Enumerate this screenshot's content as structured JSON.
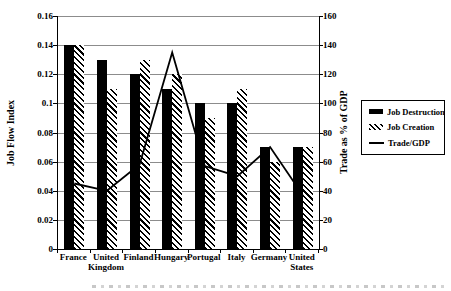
{
  "chart_data": {
    "type": "combo-bar-line",
    "title": "",
    "categories": [
      "France",
      "United Kingdom",
      "Finland",
      "Hungary",
      "Portugal",
      "Italy",
      "Germany",
      "United States"
    ],
    "series": [
      {
        "name": "Job Destruction",
        "type": "bar",
        "style": "solid-black",
        "axis": "left",
        "values": [
          0.14,
          0.13,
          0.12,
          0.11,
          0.1,
          0.1,
          0.07,
          0.07
        ]
      },
      {
        "name": "Job Creation",
        "type": "bar",
        "style": "diagonal-hatch",
        "axis": "left",
        "values": [
          0.14,
          0.11,
          0.13,
          0.12,
          0.09,
          0.11,
          0.06,
          0.07
        ]
      },
      {
        "name": "Trade/GDP",
        "type": "line",
        "style": "solid-line",
        "axis": "right",
        "values": [
          45,
          40,
          58,
          135,
          57,
          50,
          70,
          37
        ]
      }
    ],
    "left_axis": {
      "label": "Job Flow Index",
      "min": 0,
      "max": 0.16,
      "ticks": [
        "0.16",
        "0.14",
        "0.12",
        "0.1",
        "0.08",
        "0.06",
        "0.04",
        "0.02",
        "0"
      ]
    },
    "right_axis": {
      "label": "Trade as % of GDP",
      "min": 0,
      "max": 160,
      "ticks": [
        "160",
        "140",
        "120",
        "100",
        "80",
        "60",
        "40",
        "20",
        "0"
      ]
    },
    "legend": {
      "position": "right",
      "entries": [
        "Job Destruction",
        "Job Creation",
        "Trade/GDP"
      ]
    },
    "grid": true,
    "colors": {
      "bar_fill": "#000000",
      "hatch_stroke": "#000000",
      "line": "#000000",
      "gridline": "#8c8c8c",
      "text": "#000000",
      "background": "#ffffff"
    }
  }
}
